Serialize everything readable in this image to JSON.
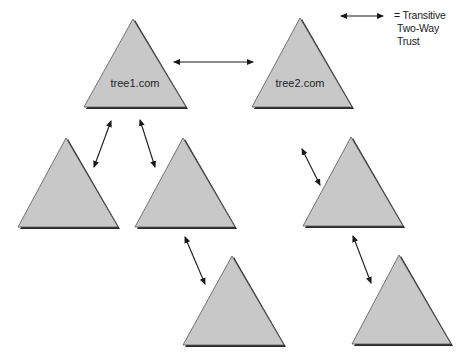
{
  "diagram": {
    "type": "forest-trust-diagram",
    "legend": {
      "symbol": "double-headed-arrow",
      "lines": [
        "= Transitive",
        "Two-Way",
        "Trust"
      ]
    },
    "trees": [
      {
        "id": "tree1",
        "label": "tree1.com"
      },
      {
        "id": "tree2",
        "label": "tree2.com"
      },
      {
        "id": "child-left",
        "label": ""
      },
      {
        "id": "child-mid",
        "label": ""
      },
      {
        "id": "child-right",
        "label": ""
      },
      {
        "id": "grandchild-mid",
        "label": ""
      },
      {
        "id": "grandchild-right",
        "label": ""
      }
    ],
    "trusts": [
      {
        "from": "tree1",
        "to": "tree2"
      },
      {
        "from": "tree1",
        "to": "child-left"
      },
      {
        "from": "tree1",
        "to": "child-mid"
      },
      {
        "from": "tree2",
        "to": "child-right"
      },
      {
        "from": "child-mid",
        "to": "grandchild-mid"
      },
      {
        "from": "child-right",
        "to": "grandchild-right"
      }
    ],
    "colors": {
      "triangle_fill": "#c8c8c8",
      "triangle_shadow": "#2a2a2a",
      "arrow": "#1a1a1a"
    }
  }
}
